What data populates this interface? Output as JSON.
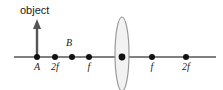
{
  "figure": {
    "title": "object",
    "kind": "thin-lens-ray-diagram"
  },
  "colors": {
    "axis": "#808080",
    "dot": "#111111",
    "arrow": "#555555",
    "lens_stroke": "#9a9a9a",
    "lens_fill": "#f2f2f2",
    "text": "#1a1a1a"
  },
  "object_arrow": {
    "label": "object",
    "label_x": 20,
    "label_y": 14,
    "x": 37,
    "base_y": 57,
    "tip_y": 20
  },
  "axis": {
    "y": 57,
    "x_start": 14,
    "x_end": 216
  },
  "lens": {
    "name": "converging-lens",
    "cx": 122,
    "cy": 54,
    "rx": 7,
    "ry": 37
  },
  "points": [
    {
      "id": "A",
      "label": "A",
      "x": 37,
      "dot_y": 57,
      "label_x": 37,
      "label_y": 70,
      "label_above": false
    },
    {
      "id": "2f-left",
      "label": "2f",
      "x": 55,
      "dot_y": 57,
      "label_x": 55,
      "label_y": 70,
      "label_above": false
    },
    {
      "id": "B",
      "label": "B",
      "x": 72,
      "dot_y": 57,
      "label_x": 69,
      "label_y": 46,
      "label_above": true
    },
    {
      "id": "f-left",
      "label": "f",
      "x": 89,
      "dot_y": 57,
      "label_x": 89,
      "label_y": 70,
      "label_above": false
    },
    {
      "id": "center",
      "label": "",
      "x": 122,
      "dot_y": 57,
      "label_x": 122,
      "label_y": 70,
      "label_above": false
    },
    {
      "id": "f-right",
      "label": "f",
      "x": 152,
      "dot_y": 57,
      "label_x": 152,
      "label_y": 70,
      "label_above": false
    },
    {
      "id": "2f-right",
      "label": "2f",
      "x": 186,
      "dot_y": 57,
      "label_x": 186,
      "label_y": 70,
      "label_above": false
    }
  ],
  "dot_radius": 3
}
